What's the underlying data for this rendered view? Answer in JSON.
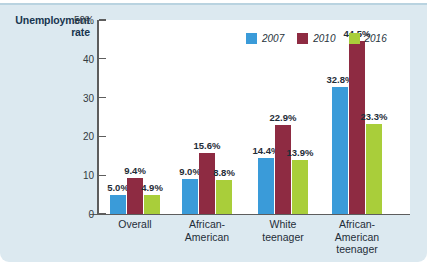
{
  "chart_data": {
    "type": "bar",
    "title": "",
    "ylabel": "Unemployment rate",
    "xlabel": "",
    "ylim": [
      0,
      50
    ],
    "yticks": [
      {
        "value": 50,
        "label": "50%"
      },
      {
        "value": 40,
        "label": "40"
      },
      {
        "value": 30,
        "label": "30"
      },
      {
        "value": 20,
        "label": "20"
      },
      {
        "value": 10,
        "label": "10"
      },
      {
        "value": 0,
        "label": "0"
      }
    ],
    "grid": false,
    "legend_position": "top-right",
    "categories": [
      {
        "line1": "Overall",
        "line2": "",
        "line3": ""
      },
      {
        "line1": "African-",
        "line2": "American",
        "line3": ""
      },
      {
        "line1": "White",
        "line2": "teenager",
        "line3": ""
      },
      {
        "line1": "African-",
        "line2": "American",
        "line3": "teenager"
      }
    ],
    "series": [
      {
        "name": "2007",
        "color": "#3a9bd9",
        "values": [
          5.0,
          9.0,
          14.4,
          32.8
        ],
        "labels": [
          "5.0%",
          "9.0%",
          "14.4%",
          "32.8%"
        ]
      },
      {
        "name": "2010",
        "color": "#8e2b42",
        "values": [
          9.4,
          15.6,
          22.9,
          44.5
        ],
        "labels": [
          "9.4%",
          "15.6%",
          "22.9%",
          "44.5%"
        ]
      },
      {
        "name": "2016",
        "color": "#a9ce3a",
        "values": [
          4.9,
          8.8,
          13.9,
          23.3
        ],
        "labels": [
          "4.9%",
          "8.8%",
          "13.9%",
          "23.3%"
        ]
      }
    ]
  },
  "axis_title": {
    "line1": "Unemployment",
    "line2": "rate"
  },
  "colors": {
    "panel_background": "#dce9f0",
    "plot_background": "#ffffff",
    "axis": "#5d5d5d",
    "text": "#1f2d38",
    "title_text": "#17354f"
  }
}
